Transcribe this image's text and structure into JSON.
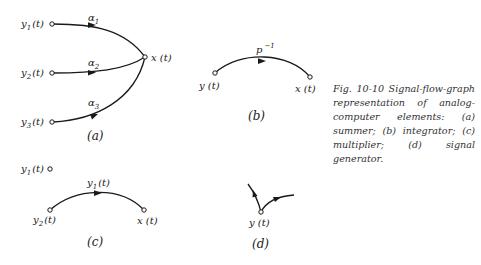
{
  "caption": {
    "text": "Fig. 10-10 Signal-flow-graph representation of analog-computer elements: (a) summer; (b) integrator; (c) multiplier; (d) signal generator."
  },
  "panels": {
    "a": {
      "label": "(a)",
      "inputs": [
        {
          "var": "y",
          "sub": "1",
          "arg": "(t)"
        },
        {
          "var": "y",
          "sub": "2",
          "arg": "(t)"
        },
        {
          "var": "y",
          "sub": "3",
          "arg": "(t)"
        }
      ],
      "gains": [
        {
          "var": "α",
          "sub": "1"
        },
        {
          "var": "α",
          "sub": "2"
        },
        {
          "var": "α",
          "sub": "3"
        }
      ],
      "output": "x (t)"
    },
    "b": {
      "label": "(b)",
      "input": "y (t)",
      "output": "x (t)",
      "gain": {
        "base": "p",
        "exp": "−1"
      }
    },
    "c": {
      "label": "(c)",
      "control": {
        "var": "y",
        "sub": "1",
        "arg": "(t)"
      },
      "input": {
        "var": "y",
        "sub": "2",
        "arg": "(t)"
      },
      "gain": {
        "var": "y",
        "sub": "1",
        "arg": "(t)"
      },
      "output": "x (t)"
    },
    "d": {
      "label": "(d)",
      "node": "y (t)"
    }
  }
}
